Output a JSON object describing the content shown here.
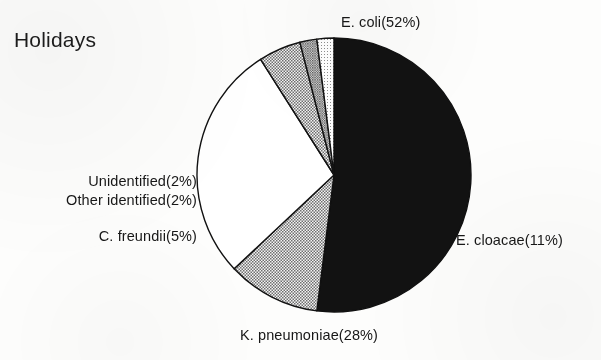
{
  "chart": {
    "title": "Holidays"
  },
  "chart_data": {
    "type": "pie",
    "title": "Holidays",
    "xlabel": "",
    "ylabel": "",
    "units": "percent",
    "legend_position": "none",
    "labels_inline": true,
    "grid": false,
    "start_angle_deg": 0,
    "direction": "clockwise",
    "center": {
      "x": 334,
      "y": 175,
      "radius": 137
    },
    "categories": [
      "E. coli",
      "E. cloacae",
      "K. pneumoniae",
      "C. freundii",
      "Other identified",
      "Unidentified"
    ],
    "values": [
      52,
      11,
      28,
      5,
      2,
      2
    ],
    "slices": [
      {
        "name": "E. coli",
        "value": 52,
        "label": "E. coli(52%)",
        "fill": "solid-black",
        "color": "#121212",
        "start_deg": 0,
        "end_deg": 187.2
      },
      {
        "name": "E. cloacae",
        "value": 11,
        "label": "E. cloacae(11%)",
        "fill": "dots-medium",
        "color": "#b5b5b5",
        "start_deg": 187.2,
        "end_deg": 226.8
      },
      {
        "name": "K. pneumoniae",
        "value": 28,
        "label": "K. pneumoniae(28%)",
        "fill": "solid-white",
        "color": "#ffffff",
        "start_deg": 226.8,
        "end_deg": 327.6
      },
      {
        "name": "C. freundii",
        "value": 5,
        "label": "C. freundii(5%)",
        "fill": "dots-medium",
        "color": "#b0b0b0",
        "start_deg": 327.6,
        "end_deg": 345.6
      },
      {
        "name": "Other identified",
        "value": 2,
        "label": "Other identified(2%)",
        "fill": "dots-dense",
        "color": "#9a9a9a",
        "start_deg": 345.6,
        "end_deg": 352.8
      },
      {
        "name": "Unidentified",
        "value": 2,
        "label": "Unidentified(2%)",
        "fill": "dots-light",
        "color": "#d8d8d8",
        "start_deg": 352.8,
        "end_deg": 360
      }
    ],
    "outline_color": "#111111"
  }
}
